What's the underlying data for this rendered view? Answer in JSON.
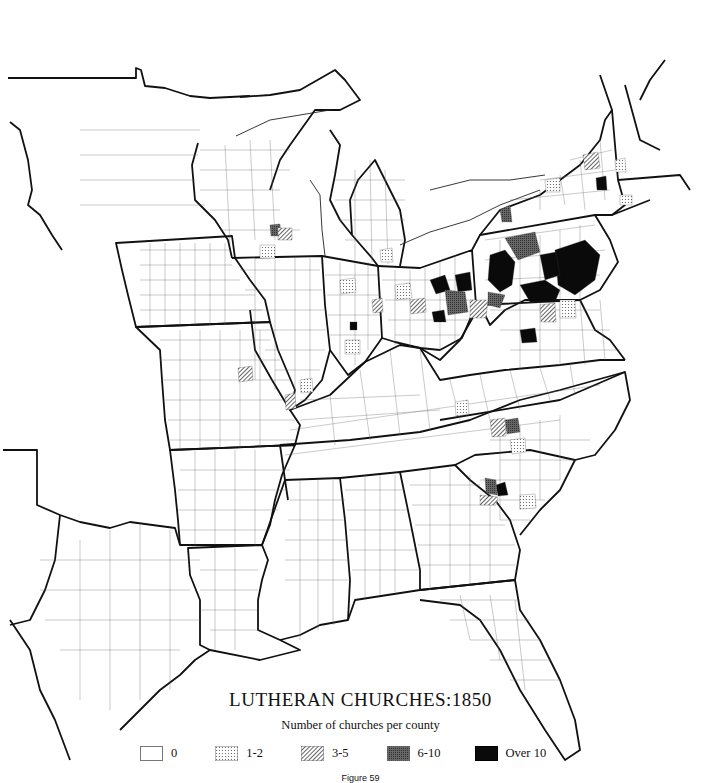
{
  "title": "LUTHERAN CHURCHES:1850",
  "subtitle": "Number of churches per county",
  "figure_label": "Figure 59",
  "legend": {
    "items": [
      {
        "label": "0",
        "pattern": "blank"
      },
      {
        "label": "1-2",
        "pattern": "dots"
      },
      {
        "label": "3-5",
        "pattern": "hatch"
      },
      {
        "label": "6-10",
        "pattern": "dense-gray"
      },
      {
        "label": "Over 10",
        "pattern": "solid-black"
      }
    ]
  },
  "map": {
    "type": "choropleth",
    "region": "Eastern United States",
    "units": "counties",
    "colors": {
      "blank": "#ffffff",
      "dots": "#d8d8d8",
      "hatch": "#8a8a8a",
      "dense-gray": "#555555",
      "solid-black": "#0a0a0a",
      "state_border": "#111111",
      "county_border": "#444444"
    }
  }
}
